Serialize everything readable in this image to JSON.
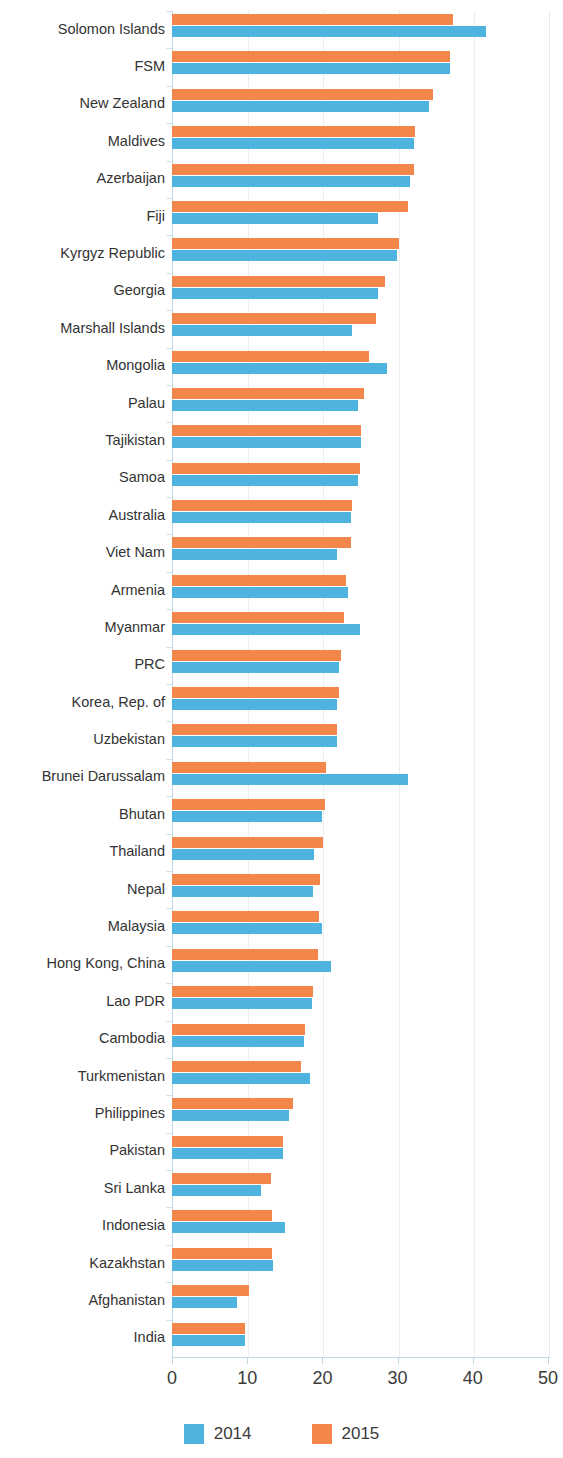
{
  "chart_data": {
    "type": "bar",
    "orientation": "horizontal",
    "title": "",
    "xlabel": "",
    "ylabel": "",
    "xlim": [
      0,
      50
    ],
    "xticks": [
      0,
      10,
      20,
      30,
      40,
      50
    ],
    "grid": true,
    "legend_position": "bottom",
    "categories": [
      "Solomon Islands",
      "FSM",
      "New Zealand",
      "Maldives",
      "Azerbaijan",
      "Fiji",
      "Kyrgyz Republic",
      "Georgia",
      "Marshall Islands",
      "Mongolia",
      "Palau",
      "Tajikistan",
      "Samoa",
      "Australia",
      "Viet Nam",
      "Armenia",
      "Myanmar",
      "PRC",
      "Korea, Rep. of",
      "Uzbekistan",
      "Brunei Darussalam",
      "Bhutan",
      "Thailand",
      "Nepal",
      "Malaysia",
      "Hong Kong, China",
      "Lao PDR",
      "Cambodia",
      "Turkmenistan",
      "Philippines",
      "Pakistan",
      "Sri Lanka",
      "Indonesia",
      "Kazakhstan",
      "Afghanistan",
      "India"
    ],
    "series": [
      {
        "name": "2014",
        "color": "#4FB3DF",
        "values": [
          41.8,
          37.0,
          34.2,
          32.2,
          31.7,
          27.4,
          29.9,
          27.4,
          23.9,
          28.6,
          24.7,
          25.1,
          24.7,
          23.8,
          22.0,
          23.4,
          25.0,
          22.2,
          22.0,
          22.0,
          31.4,
          19.9,
          18.9,
          18.7,
          19.9,
          21.1,
          18.6,
          17.5,
          18.4,
          15.6,
          14.7,
          11.8,
          15.0,
          13.4,
          8.6,
          9.7
        ]
      },
      {
        "name": "2015",
        "color": "#F2864B",
        "values": [
          37.4,
          37.0,
          34.7,
          32.3,
          32.2,
          31.4,
          30.2,
          28.3,
          27.1,
          26.2,
          25.5,
          25.1,
          25.0,
          23.9,
          23.8,
          23.1,
          22.9,
          22.5,
          22.2,
          22.0,
          20.5,
          20.3,
          20.1,
          19.7,
          19.6,
          19.4,
          18.8,
          17.7,
          17.2,
          16.1,
          14.7,
          13.1,
          13.3,
          13.3,
          10.2,
          9.7
        ]
      }
    ]
  },
  "legend": {
    "items": [
      {
        "label": "2014",
        "color": "#4FB3DF"
      },
      {
        "label": "2015",
        "color": "#F2864B"
      }
    ]
  },
  "colors": {
    "series_2014": "#4FB3DF",
    "series_2015": "#F2864B",
    "axis": "#bcd9e6",
    "grid": "#e7eff3",
    "text": "#3a3a3a"
  }
}
